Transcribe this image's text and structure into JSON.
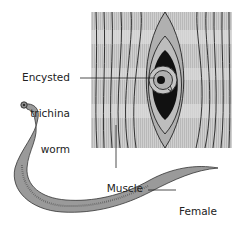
{
  "figure": {
    "labels": {
      "trichina": [
        "Encysted",
        "trichina",
        "worm"
      ],
      "muscle": "Muscle",
      "hookworm": [
        "Female",
        "hookworm"
      ]
    },
    "colors": {
      "muscle_fill": "#c9c9c9",
      "muscle_band_light": "#dcdcdc",
      "cyst_dark": "#111111",
      "cyst_gray": "#a8a8a8",
      "worm_fill": "#9a9a9a",
      "line": "#222222"
    }
  }
}
